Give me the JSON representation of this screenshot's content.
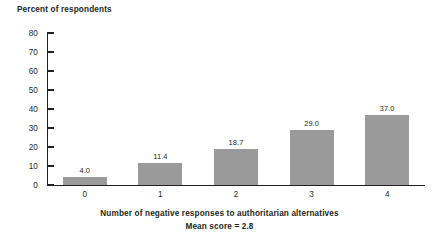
{
  "chart_data": {
    "type": "bar",
    "title": "",
    "subtitle": "",
    "categories": [
      "0",
      "1",
      "2",
      "3",
      "4"
    ],
    "values": [
      4.0,
      11.4,
      18.7,
      29.0,
      37.0
    ],
    "value_labels": [
      "4.0",
      "11.4",
      "18.7",
      "29.0",
      "37.0"
    ],
    "xlabel": "Number of negative responses to authoritarian alternatives",
    "ylabel": "Percent of respondents",
    "annotation": "Mean score = 2.8",
    "ylim": [
      0,
      80
    ],
    "ytick_labels": [
      "80",
      "70",
      "60",
      "50",
      "40",
      "30",
      "20",
      "10",
      "0"
    ],
    "ytick_values": [
      80,
      70,
      60,
      50,
      40,
      30,
      20,
      10,
      0
    ],
    "grid": false,
    "legend": false,
    "bar_color": "#9a9a9a",
    "axis_color": "#231f20",
    "background_color": "#ffffff"
  }
}
